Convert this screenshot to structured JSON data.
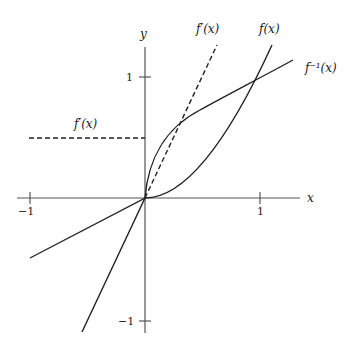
{
  "figure": {
    "axes": {
      "x_label": "x",
      "y_label": "y",
      "x_ticks": [
        {
          "value": -1,
          "label": "−1"
        },
        {
          "value": 1,
          "label": "1"
        }
      ],
      "y_ticks": [
        {
          "value": 1,
          "label": "1"
        },
        {
          "value": -1,
          "label": "−1"
        }
      ]
    },
    "curves": [
      {
        "name": "f",
        "label": "f(x)",
        "style": "solid"
      },
      {
        "name": "f_inverse",
        "label": "f⁻¹(x)",
        "style": "solid"
      },
      {
        "name": "f_prime_right",
        "label": "f′(x)",
        "style": "dashed"
      },
      {
        "name": "f_prime_left",
        "label": "f′(x)",
        "style": "dashed"
      }
    ],
    "colors": {
      "ink": "#222222",
      "axis": "#555555",
      "background": "#ffffff"
    }
  }
}
